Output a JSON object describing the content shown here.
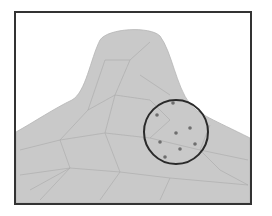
{
  "figure": {
    "colors": {
      "background": "#ffffff",
      "frame": "#333333",
      "surface_fill": "#c9c9c9",
      "mesh_lines": "#a9a9a9",
      "circle": "#2a2a2a",
      "points": "#6e6e6e"
    },
    "frame": {
      "x": 15,
      "y": 12,
      "width": 236,
      "height": 192
    },
    "surface_outline": "M16,132 C34,122 55,108 72,100 C86,92 90,60 100,40 C108,28 150,26 160,36 C172,52 176,86 190,104 C198,114 214,120 250,138 L250,203 L16,203 Z",
    "highlight_circle": {
      "cx": 176,
      "cy": 132,
      "r": 32
    },
    "sample_points": [
      {
        "x": 173,
        "y": 103
      },
      {
        "x": 157,
        "y": 115
      },
      {
        "x": 190,
        "y": 128
      },
      {
        "x": 176,
        "y": 133
      },
      {
        "x": 160,
        "y": 142
      },
      {
        "x": 195,
        "y": 144
      },
      {
        "x": 180,
        "y": 149
      },
      {
        "x": 165,
        "y": 157
      }
    ],
    "mesh_segments": [
      [
        20,
        150,
        60,
        140
      ],
      [
        60,
        140,
        105,
        133
      ],
      [
        105,
        133,
        150,
        138
      ],
      [
        150,
        138,
        200,
        150
      ],
      [
        200,
        150,
        248,
        160
      ],
      [
        20,
        175,
        70,
        168
      ],
      [
        70,
        168,
        120,
        172
      ],
      [
        120,
        172,
        170,
        178
      ],
      [
        170,
        178,
        248,
        185
      ],
      [
        60,
        140,
        70,
        168
      ],
      [
        105,
        133,
        120,
        172
      ],
      [
        70,
        168,
        40,
        200
      ],
      [
        120,
        172,
        100,
        200
      ],
      [
        170,
        178,
        160,
        200
      ],
      [
        105,
        133,
        115,
        95
      ],
      [
        115,
        95,
        130,
        60
      ],
      [
        130,
        60,
        150,
        42
      ],
      [
        115,
        95,
        150,
        100
      ],
      [
        150,
        100,
        170,
        120
      ],
      [
        88,
        110,
        115,
        95
      ],
      [
        88,
        110,
        60,
        140
      ],
      [
        140,
        75,
        170,
        95
      ],
      [
        105,
        60,
        130,
        60
      ],
      [
        105,
        60,
        88,
        110
      ],
      [
        150,
        138,
        170,
        120
      ],
      [
        200,
        150,
        210,
        125
      ],
      [
        30,
        190,
        70,
        168
      ],
      [
        220,
        170,
        200,
        150
      ],
      [
        220,
        170,
        248,
        185
      ]
    ]
  }
}
